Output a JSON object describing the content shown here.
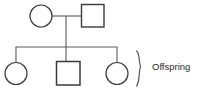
{
  "diagram": {
    "type": "pedigree",
    "background_color": "#ffffff",
    "stroke_color": "#3a3a3a",
    "line_color": "#5a5a5a",
    "text_color": "#2b2b2b",
    "shape_fill": "#ffffff"
  },
  "generations": [
    {
      "name": "parents",
      "label": "",
      "members": [
        {
          "id": "mother",
          "symbol": "circle",
          "sex": "female",
          "shape_name": "circle-female-parent",
          "cx": 41,
          "cy": 16,
          "r": 11
        },
        {
          "id": "father",
          "symbol": "square",
          "sex": "male",
          "shape_name": "square-male-parent",
          "x": 81,
          "y": 4,
          "size": 23
        }
      ]
    },
    {
      "name": "children",
      "label": "Offspring",
      "members": [
        {
          "id": "daughter-left",
          "symbol": "circle",
          "sex": "female",
          "shape_name": "circle-female-child-left",
          "cx": 16,
          "cy": 73,
          "r": 11
        },
        {
          "id": "son-center",
          "symbol": "square",
          "sex": "male",
          "shape_name": "square-male-child-center",
          "x": 56,
          "y": 61,
          "size": 24
        },
        {
          "id": "daughter-right",
          "symbol": "circle",
          "sex": "female",
          "shape_name": "circle-female-child-right",
          "cx": 117,
          "cy": 73,
          "r": 11
        }
      ]
    }
  ],
  "connectors": {
    "mating_line": {
      "x1": 52,
      "y1": 16,
      "x2": 81,
      "y2": 16
    },
    "descent_line": {
      "x1": 66,
      "y1": 16,
      "x2": 66,
      "y2": 47
    },
    "sibship_line": {
      "x1": 16,
      "y1": 47,
      "x2": 117,
      "y2": 47
    },
    "drop_lines": [
      {
        "x1": 16,
        "y1": 47,
        "x2": 16,
        "y2": 62
      },
      {
        "x1": 66,
        "y1": 47,
        "x2": 66,
        "y2": 61
      },
      {
        "x1": 117,
        "y1": 47,
        "x2": 117,
        "y2": 62
      }
    ]
  },
  "annotation": {
    "brace": {
      "name": "curly-brace",
      "glyph": "}",
      "x": 137,
      "y_top": 51,
      "y_bottom": 86
    },
    "label": {
      "text": "Offspring",
      "x": 152,
      "y": 67,
      "font_size": 9
    }
  }
}
